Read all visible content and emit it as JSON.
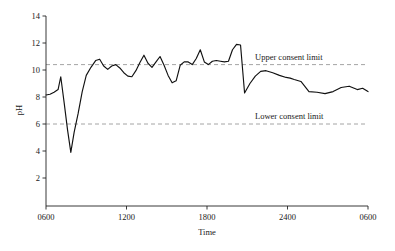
{
  "chart_data": {
    "type": "line",
    "title": "",
    "xlabel": "Time",
    "ylabel": "pH",
    "ylim": [
      0,
      14
    ],
    "xlim": [
      0,
      24
    ],
    "grid": false,
    "legend_position": "inline-annotation",
    "y_ticks": [
      2,
      4,
      6,
      8,
      10,
      12,
      14
    ],
    "y_tick_labels": [
      "2",
      "4",
      "6",
      "8",
      "10",
      "12",
      "14"
    ],
    "x_ticks": [
      0,
      6,
      12,
      18,
      24
    ],
    "x_tick_labels": [
      "0600",
      "1200",
      "1800",
      "2400",
      "0600"
    ],
    "annotations": [
      {
        "text": "Upper consent limit",
        "value": 10.4
      },
      {
        "text": "Lower consent limit",
        "value": 6.0
      }
    ],
    "reference_lines": [
      {
        "name": "upper_consent_limit",
        "value": 10.4,
        "style": "dashed",
        "color": "#9a9a9a"
      },
      {
        "name": "lower_consent_limit",
        "value": 6.0,
        "style": "dashed",
        "color": "#9a9a9a"
      }
    ],
    "series": [
      {
        "name": "pH",
        "color": "#111111",
        "x": [
          0.0,
          0.3,
          0.6,
          0.9,
          1.1,
          1.35,
          1.6,
          1.85,
          2.1,
          2.4,
          2.7,
          3.0,
          3.35,
          3.7,
          4.0,
          4.3,
          4.6,
          4.9,
          5.2,
          5.5,
          5.8,
          6.1,
          6.4,
          6.7,
          7.0,
          7.3,
          7.6,
          7.9,
          8.2,
          8.5,
          8.8,
          9.1,
          9.4,
          9.7,
          10.0,
          10.3,
          10.6,
          10.9,
          11.2,
          11.5,
          11.8,
          12.1,
          12.4,
          12.7,
          13.0,
          13.3,
          13.6,
          13.9,
          14.2,
          14.5,
          14.8,
          15.2,
          15.6,
          16.0,
          16.4,
          16.9,
          17.4,
          17.9,
          18.2,
          18.5,
          19.0,
          19.6,
          20.2,
          20.8,
          21.4,
          22.0,
          22.6,
          23.2,
          23.6,
          24.0
        ],
        "values": [
          8.15,
          8.2,
          8.35,
          8.55,
          9.5,
          7.6,
          5.6,
          3.9,
          5.4,
          6.8,
          8.4,
          9.6,
          10.2,
          10.7,
          10.8,
          10.3,
          10.05,
          10.3,
          10.4,
          10.15,
          9.8,
          9.55,
          9.5,
          9.95,
          10.55,
          11.1,
          10.5,
          10.2,
          10.6,
          11.0,
          10.35,
          9.6,
          9.05,
          9.2,
          10.35,
          10.6,
          10.6,
          10.4,
          10.85,
          11.5,
          10.6,
          10.4,
          10.65,
          10.7,
          10.65,
          10.6,
          10.65,
          11.5,
          11.9,
          11.85,
          8.3,
          9.0,
          9.55,
          9.9,
          9.95,
          9.8,
          9.6,
          9.45,
          9.4,
          9.3,
          9.15,
          8.4,
          8.35,
          8.25,
          8.4,
          8.7,
          8.8,
          8.55,
          8.65,
          8.4
        ]
      }
    ]
  }
}
